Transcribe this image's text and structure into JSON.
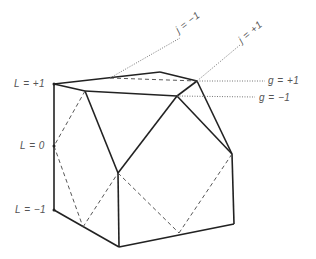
{
  "diagram": {
    "labels": {
      "L_plus": "L = +1",
      "L_zero": "L = 0",
      "L_minus": "L = −1",
      "g_plus": "g = +1",
      "g_minus": "g = −1",
      "j_minus": "j = −1",
      "j_plus": "j = +1"
    },
    "colors": {
      "solid": "#222222",
      "dashed": "#444444",
      "dotted": "#666666"
    }
  }
}
